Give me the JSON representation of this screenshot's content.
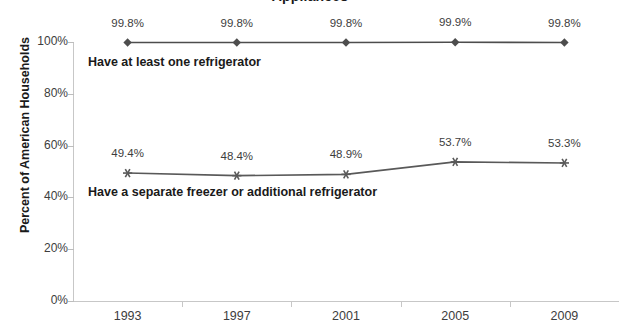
{
  "chart_data": {
    "type": "line",
    "title": "Appliances",
    "xlabel": "",
    "ylabel": "Percent of American Households",
    "categories": [
      "1993",
      "1997",
      "2001",
      "2005",
      "2009"
    ],
    "x_tick_labels": [
      "1993",
      "1997",
      "2001",
      "2005",
      "2009"
    ],
    "y_tick_labels": [
      "0%",
      "20%",
      "40%",
      "60%",
      "80%",
      "100%"
    ],
    "y_tick_values": [
      0,
      20,
      40,
      60,
      80,
      100
    ],
    "ylim": [
      0,
      100
    ],
    "grid": false,
    "legend_position": "inline-annotation",
    "series": [
      {
        "name": "Have at least one refrigerator",
        "marker": "diamond",
        "color": "#4d4d4d",
        "values": [
          99.8,
          99.8,
          99.8,
          99.9,
          99.8
        ],
        "data_labels": [
          "99.8%",
          "99.8%",
          "99.8%",
          "99.9%",
          "99.8%"
        ],
        "annotation": "Have at least one refrigerator"
      },
      {
        "name": "Have a separate freezer or additional refrigerator",
        "marker": "star",
        "color": "#595959",
        "values": [
          49.4,
          48.4,
          48.9,
          53.7,
          53.3
        ],
        "data_labels": [
          "49.4%",
          "48.4%",
          "48.9%",
          "53.7%",
          "53.3%"
        ],
        "annotation": "Have a separate freezer or additional refrigerator"
      }
    ],
    "colors": {
      "axis": "#c7c7c7",
      "tick_text": "#3d3d3d",
      "title_text": "#1a1a1a",
      "series1": "#4d4d4d",
      "series2": "#595959",
      "background": "#ffffff"
    }
  }
}
